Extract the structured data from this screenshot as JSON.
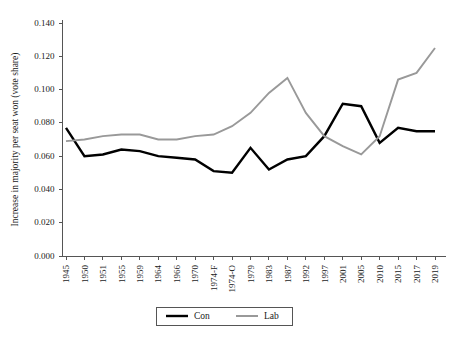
{
  "chart_data": {
    "type": "line",
    "title": "",
    "xlabel": "",
    "ylabel": "Increase in majority per seat won (vote share)",
    "ylim": [
      0.0,
      0.14
    ],
    "ytick_labels": [
      "0.000",
      "0.020",
      "0.040",
      "0.060",
      "0.080",
      "0.100",
      "0.120",
      "0.140"
    ],
    "ytick_values": [
      0.0,
      0.02,
      0.04,
      0.06,
      0.08,
      0.1,
      0.12,
      0.14
    ],
    "grid": false,
    "legend_position": "bottom-center",
    "categories": [
      "1945",
      "1950",
      "1951",
      "1955",
      "1959",
      "1964",
      "1966",
      "1970",
      "1974-F",
      "1974-O",
      "1979",
      "1983",
      "1987",
      "1992",
      "1997",
      "2001",
      "2005",
      "2010",
      "2015",
      "2017",
      "2019"
    ],
    "series": [
      {
        "name": "Con",
        "color": "#000000",
        "values": [
          0.077,
          0.06,
          0.061,
          0.064,
          0.063,
          0.06,
          0.059,
          0.058,
          0.051,
          0.05,
          0.065,
          0.052,
          0.058,
          0.06,
          0.072,
          0.0915,
          0.09,
          0.068,
          0.077,
          0.075,
          0.075
        ]
      },
      {
        "name": "Lab",
        "color": "#999999",
        "values": [
          0.069,
          0.07,
          0.072,
          0.073,
          0.073,
          0.07,
          0.07,
          0.072,
          0.073,
          0.078,
          0.086,
          0.098,
          0.107,
          0.086,
          0.072,
          0.066,
          0.061,
          0.072,
          0.106,
          0.11,
          0.125
        ]
      }
    ],
    "legend": [
      {
        "label": "Con",
        "color": "#000000",
        "width": 2.4
      },
      {
        "label": "Lab",
        "color": "#999999",
        "width": 2.0
      }
    ]
  },
  "colors": {
    "con": "#000000",
    "lab": "#999999",
    "axis": "#555555",
    "background": "#ffffff"
  }
}
